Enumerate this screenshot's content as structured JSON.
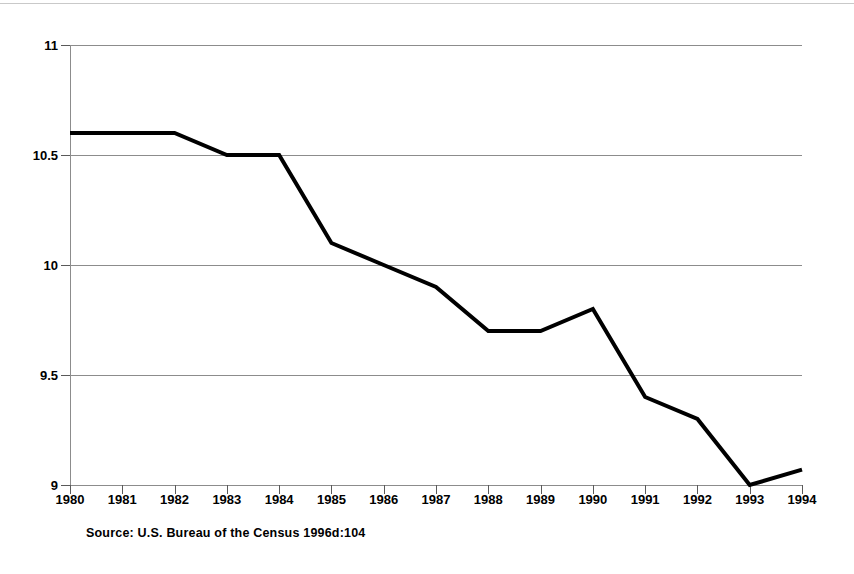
{
  "figure": {
    "background_color": "#ffffff",
    "source_note": "Source: U.S. Bureau of the Census 1996d:104"
  },
  "chart_data": {
    "type": "line",
    "title": "",
    "subtitle": "",
    "xlabel": "",
    "ylabel": "",
    "categories": [
      "1980",
      "1981",
      "1982",
      "1983",
      "1984",
      "1985",
      "1986",
      "1987",
      "1988",
      "1989",
      "1990",
      "1991",
      "1992",
      "1993",
      "1994"
    ],
    "x": [
      1980,
      1981,
      1982,
      1983,
      1984,
      1985,
      1986,
      1987,
      1988,
      1989,
      1990,
      1991,
      1992,
      1993,
      1994
    ],
    "values": [
      10.6,
      10.6,
      10.6,
      10.5,
      10.5,
      10.1,
      10.0,
      9.9,
      9.7,
      9.7,
      9.8,
      9.4,
      9.3,
      9.0,
      9.07
    ],
    "ylim": [
      9,
      11
    ],
    "xlim": [
      1980,
      1994
    ],
    "yticks": [
      9,
      9.5,
      10,
      10.5,
      11
    ],
    "ytick_labels": [
      "9",
      "9.5",
      "10",
      "10.5",
      "11"
    ],
    "xtick_labels": [
      "1980",
      "1981",
      "1982",
      "1983",
      "1984",
      "1985",
      "1986",
      "1987",
      "1988",
      "1989",
      "1990",
      "1991",
      "1992",
      "1993",
      "1994"
    ],
    "grid": true,
    "grid_axis": "y",
    "grid_color": "#8c8c8c",
    "legend": false,
    "legend_position": "none",
    "series": [
      {
        "name": "",
        "color": "#000000",
        "line_width": 4,
        "marker": "none",
        "values": [
          10.6,
          10.6,
          10.6,
          10.5,
          10.5,
          10.1,
          10.0,
          9.9,
          9.7,
          9.7,
          9.8,
          9.4,
          9.3,
          9.0,
          9.07
        ]
      }
    ]
  }
}
